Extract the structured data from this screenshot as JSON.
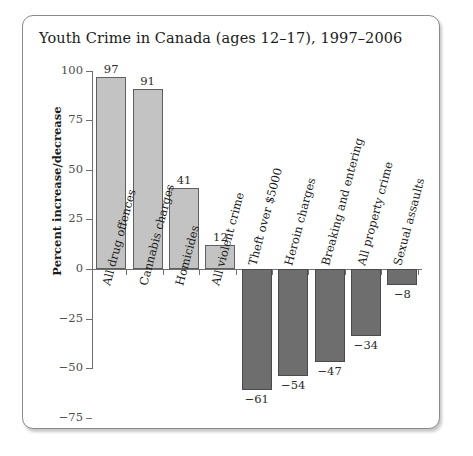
{
  "chart_data": {
    "type": "bar",
    "title": "Youth Crime in Canada (ages 12–17), 1997–2006",
    "xlabel": "",
    "ylabel": "Percent increase/decrease",
    "ylim": [
      -75,
      100
    ],
    "yticks": [
      "100",
      "75",
      "50",
      "25",
      "0",
      "−25",
      "−50",
      "−75"
    ],
    "ytick_values": [
      100,
      75,
      50,
      25,
      0,
      -25,
      -50,
      -75
    ],
    "grid": false,
    "legend": "none",
    "categories": [
      "All drug offences",
      "Cannabis charges",
      "Homicides",
      "All violent crime",
      "Theft over $5000",
      "Heroin charges",
      "Breaking and entering",
      "All property crime",
      "Sexual assaults"
    ],
    "values": [
      97,
      91,
      41,
      12,
      -61,
      -54,
      -47,
      -34,
      -8
    ],
    "value_labels": [
      "97",
      "91",
      "41",
      "12",
      "−61",
      "−54",
      "−47",
      "−34",
      "−8"
    ],
    "colors": {
      "positive_bar": "#c3c3c3",
      "negative_bar": "#6e6e6e",
      "bar_outline": "#5f5f5f",
      "axis": "#6f6f6f",
      "text": "#1b1b1b",
      "card_border": "#8a8a8a",
      "background": "#ffffff"
    }
  }
}
